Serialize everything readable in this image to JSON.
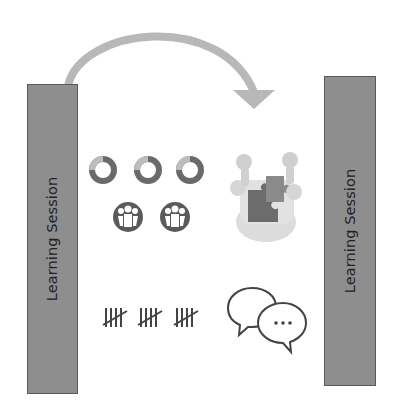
{
  "diagram": {
    "left_session": {
      "label": "Learning Session"
    },
    "right_session": {
      "label": "Learning Session"
    },
    "arrow": {
      "direction": "left-to-right",
      "color": "#b8b8b8"
    },
    "icons": [
      {
        "name": "cycle-ring-icon",
        "count": 3
      },
      {
        "name": "people-circle-icon",
        "count": 2
      },
      {
        "name": "puzzle-team-icon",
        "count": 1
      },
      {
        "name": "tally-marks-icon",
        "count": 3
      },
      {
        "name": "chat-bubbles-icon",
        "count": 1
      }
    ],
    "colors": {
      "bar_fill": "#8e8e8e",
      "bar_border": "#5a5a5a",
      "icon_dark": "#555555",
      "arrow": "#b8b8b8"
    }
  }
}
